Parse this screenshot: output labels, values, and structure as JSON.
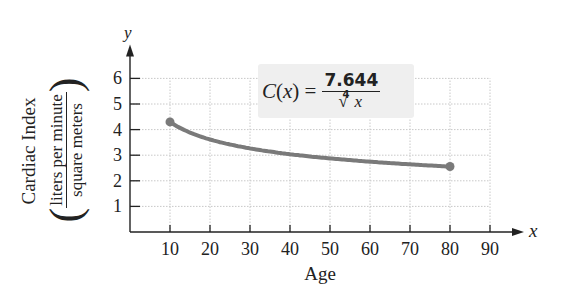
{
  "chart_data": {
    "type": "line",
    "title": "",
    "function_label": {
      "lhs": "C(x) =",
      "numerator": "7.644",
      "denominator_index": "4",
      "denominator_var": "x",
      "text": "C(x) = 7.644 / ⁴√x"
    },
    "xlabel": "Age",
    "ylabel": "Cardiac Index",
    "ylabel_units_numerator": "liters per minute",
    "ylabel_units_denominator": "square meters",
    "x_axis_symbol": "x",
    "y_axis_symbol": "y",
    "xlim": [
      0,
      90
    ],
    "ylim": [
      0,
      6
    ],
    "x_ticks": [
      10,
      20,
      30,
      40,
      50,
      60,
      70,
      80,
      90
    ],
    "y_ticks": [
      1,
      2,
      3,
      4,
      5,
      6
    ],
    "x_tick_labels": [
      "10",
      "20",
      "30",
      "40",
      "50",
      "60",
      "70",
      "80",
      "90"
    ],
    "y_tick_labels": [
      "1",
      "2",
      "3",
      "4",
      "5",
      "6"
    ],
    "grid": true,
    "legend": null,
    "series": [
      {
        "name": "C(x) = 7.644 / x^(1/4)",
        "color": "#7a7a7a",
        "x": [
          10,
          15,
          20,
          25,
          30,
          35,
          40,
          45,
          50,
          55,
          60,
          65,
          70,
          75,
          80
        ],
        "values": [
          4.3,
          3.88,
          3.61,
          3.42,
          3.27,
          3.14,
          3.04,
          2.96,
          2.87,
          2.81,
          2.75,
          2.69,
          2.64,
          2.6,
          2.56
        ],
        "endpoints": [
          [
            10,
            4.3
          ],
          [
            80,
            2.56
          ]
        ]
      }
    ]
  }
}
